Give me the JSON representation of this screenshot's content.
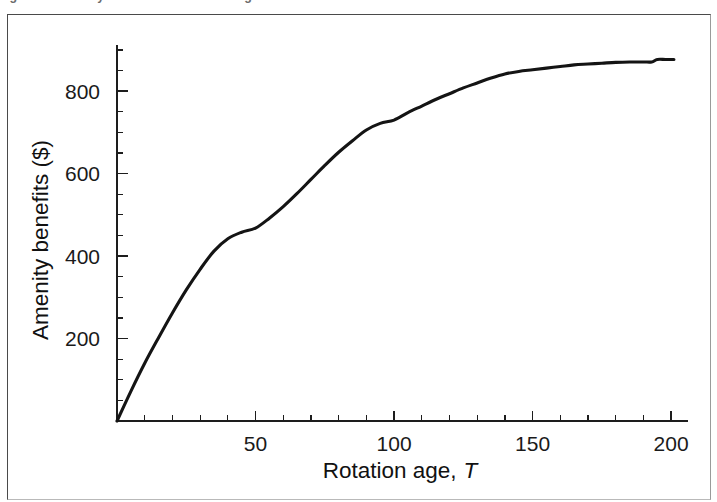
{
  "figure": {
    "caption_fragment": "igure 1. Amenity benefits and rotation age",
    "frame_color": "#4a4a4a",
    "background": "#ffffff"
  },
  "chart_data": {
    "type": "line",
    "title": "",
    "subtitle": "",
    "xlabel": "Rotation age, T",
    "xlabel_plain": "Rotation age,",
    "xlabel_symbol": "T",
    "ylabel": "Amenity benefits ($)",
    "xlim": [
      0,
      205
    ],
    "ylim": [
      0,
      900
    ],
    "xticks": [
      50,
      100,
      150,
      200
    ],
    "xtick_labels": [
      "50",
      "100",
      "150",
      "200"
    ],
    "yticks": [
      200,
      400,
      600,
      800
    ],
    "ytick_labels": [
      "200",
      "400",
      "600",
      "800"
    ],
    "x_minor_step": 10,
    "y_minor_step": 50,
    "grid": false,
    "legend": false,
    "line_color": "#141414",
    "series": [
      {
        "name": "Amenity benefits",
        "x": [
          0,
          5,
          10,
          15,
          20,
          25,
          30,
          35,
          40,
          45,
          50,
          55,
          60,
          65,
          70,
          75,
          80,
          85,
          90,
          95,
          100,
          105,
          110,
          115,
          120,
          125,
          130,
          135,
          140,
          145,
          150,
          155,
          160,
          165,
          170,
          175,
          180,
          185,
          190,
          193,
          195,
          198,
          201
        ],
        "y": [
          0,
          72,
          140,
          202,
          262,
          318,
          368,
          412,
          442,
          458,
          468,
          492,
          520,
          552,
          586,
          620,
          652,
          680,
          706,
          722,
          730,
          748,
          764,
          780,
          794,
          808,
          820,
          832,
          842,
          848,
          852,
          856,
          860,
          864,
          866,
          868,
          870,
          871,
          871,
          871,
          877,
          877,
          877
        ]
      }
    ],
    "annotations": [
      {
        "text": "curve plateaus near 875",
        "x": 195,
        "y": 877
      }
    ]
  }
}
